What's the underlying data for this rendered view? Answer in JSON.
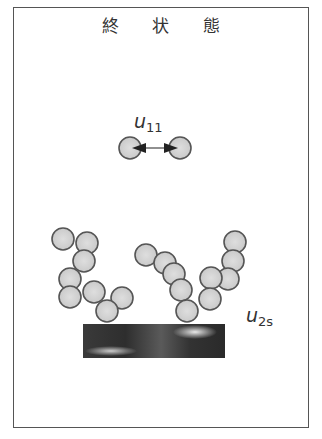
{
  "title": "終 状 態",
  "labels": {
    "u11": {
      "main": "u",
      "sub": "11"
    },
    "u2s": {
      "main": "u",
      "sub": "2s"
    }
  },
  "colors": {
    "particle_fill": "#d4d4d4",
    "particle_stroke": "#555555",
    "arrow": "#222222",
    "border": "#555555"
  },
  "particle_radius": 11,
  "isolated_pair": [
    [
      130,
      148
    ],
    [
      180,
      148
    ]
  ],
  "chains": [
    {
      "name": "left-chain",
      "particles": [
        [
          63,
          239
        ],
        [
          87,
          243
        ],
        [
          84,
          261
        ],
        [
          70,
          279
        ],
        [
          70,
          297
        ],
        [
          94,
          292
        ],
        [
          122,
          298
        ],
        [
          107,
          311
        ]
      ]
    },
    {
      "name": "middle-chain",
      "particles": [
        [
          146,
          255
        ],
        [
          165,
          263
        ],
        [
          174,
          274
        ],
        [
          181,
          290
        ],
        [
          187,
          311
        ]
      ]
    },
    {
      "name": "right-chain",
      "particles": [
        [
          235,
          242
        ],
        [
          233,
          261
        ],
        [
          228,
          279
        ],
        [
          211,
          278
        ],
        [
          210,
          299
        ]
      ]
    }
  ],
  "substrate": {
    "x": 83,
    "y": 324,
    "width": 142,
    "height": 34
  }
}
